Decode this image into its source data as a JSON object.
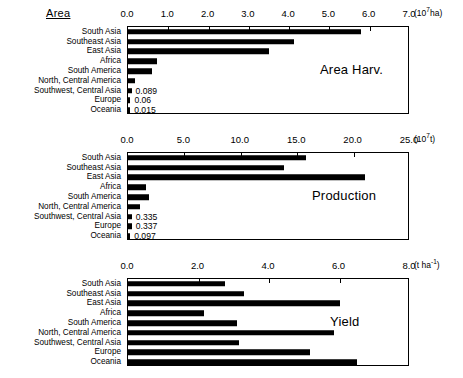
{
  "figure": {
    "corner_title": "Area",
    "categories": [
      "South Asia",
      "Southeast Asia",
      "East Asia",
      "Africa",
      "South America",
      "North, Central America",
      "Southwest, Central Asia",
      "Europe",
      "Oceania"
    ]
  },
  "chart_data": [
    {
      "type": "bar",
      "orientation": "horizontal",
      "title": "Area Harv.",
      "unit": "(10⁷ha)",
      "unit_base": "(10",
      "unit_exp": "7",
      "unit_tail": "ha)",
      "xlabel": "",
      "ylabel": "",
      "xlim": [
        0.0,
        7.0
      ],
      "grid": false,
      "tick_labels": [
        "0.0",
        "1.0",
        "2.0",
        "3.0",
        "4.0",
        "5.0",
        "6.0",
        "7.0"
      ],
      "ticks": [
        0.0,
        1.0,
        2.0,
        3.0,
        4.0,
        5.0,
        6.0,
        7.0
      ],
      "categories": [
        "South Asia",
        "Southeast Asia",
        "East Asia",
        "Africa",
        "South America",
        "North, Central America",
        "Southwest, Central Asia",
        "Europe",
        "Oceania"
      ],
      "values": [
        5.78,
        4.12,
        3.49,
        0.73,
        0.6,
        0.17,
        0.089,
        0.06,
        0.015
      ],
      "data_labels": [
        "",
        "",
        "",
        "",
        "",
        "",
        "0.089",
        "0.06",
        "0.015"
      ]
    },
    {
      "type": "bar",
      "orientation": "horizontal",
      "title": "Production",
      "unit": "(10⁷t)",
      "unit_base": "(10",
      "unit_exp": "7",
      "unit_tail": "t)",
      "xlabel": "",
      "ylabel": "",
      "xlim": [
        0.0,
        25.0
      ],
      "grid": false,
      "tick_labels": [
        "0.0",
        "5.0",
        "10.0",
        "15.0",
        "20.0",
        "25.0"
      ],
      "ticks": [
        0.0,
        5.0,
        10.0,
        15.0,
        20.0,
        25.0
      ],
      "categories": [
        "South Asia",
        "Southeast Asia",
        "East Asia",
        "Africa",
        "South America",
        "North, Central America",
        "Southwest, Central Asia",
        "Europe",
        "Oceania"
      ],
      "values": [
        15.8,
        13.8,
        21.0,
        1.6,
        1.9,
        1.1,
        0.335,
        0.337,
        0.097
      ],
      "data_labels": [
        "",
        "",
        "",
        "",
        "",
        "",
        "0.335",
        "0.337",
        "0.097"
      ]
    },
    {
      "type": "bar",
      "orientation": "horizontal",
      "title": "Yield",
      "unit": "(t ha⁻¹)",
      "unit_base": "(t ha",
      "unit_exp": "-1",
      "unit_tail": ")",
      "xlabel": "",
      "ylabel": "",
      "xlim": [
        0.0,
        8.0
      ],
      "grid": false,
      "tick_labels": [
        "0.0",
        "2.0",
        "4.0",
        "6.0",
        "8.0"
      ],
      "ticks": [
        0.0,
        2.0,
        4.0,
        6.0,
        8.0
      ],
      "categories": [
        "South Asia",
        "Southeast Asia",
        "East Asia",
        "Africa",
        "South America",
        "North, Central America",
        "Southwest, Central Asia",
        "Europe",
        "Oceania"
      ],
      "values": [
        2.75,
        3.3,
        6.0,
        2.15,
        3.1,
        5.85,
        3.15,
        5.15,
        6.5
      ],
      "data_labels": [
        "",
        "",
        "",
        "",
        "",
        "",
        "",
        "",
        ""
      ]
    }
  ]
}
